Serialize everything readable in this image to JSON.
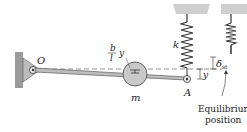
{
  "diagram": {
    "labels": {
      "pivot": "O",
      "end_point": "A",
      "mass": "m",
      "spring": "k",
      "mass_displacement_num": "b",
      "mass_displacement_den": "l",
      "mass_displacement_var": "y",
      "end_displacement": "y",
      "static_deflection": "δ",
      "static_deflection_sub": "st",
      "equilibrium_line1": "Equilibrium",
      "equilibrium_line2": "position"
    },
    "colors": {
      "stroke": "#333333",
      "ceiling": "#cfcfcf",
      "wall": "#9a9a9a",
      "mass_fill": "#c9c9c9",
      "rod_fill": "#bdbdbd",
      "dashed": "#666666"
    }
  }
}
